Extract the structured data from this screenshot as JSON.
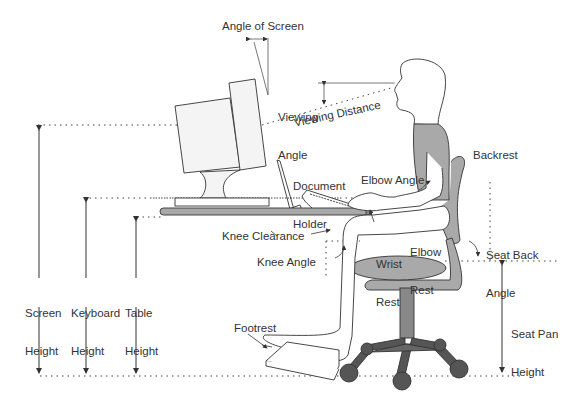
{
  "colors": {
    "line": "#333333",
    "fill_gray": "#a9a9a9",
    "dark_gray": "#555555",
    "screen_fill": "#f2f2f2",
    "background": "#ffffff"
  },
  "labels": {
    "angle_of_screen": "Angle of Screen",
    "viewing_angle": [
      "Viewing",
      "Angle"
    ],
    "viewing_distance": "Viewing Distance",
    "document_holder": [
      "Document",
      "Holder"
    ],
    "backrest": "Backrest",
    "elbow_angle": "Elbow Angle",
    "elbow_rest": [
      "Elbow",
      "Rest"
    ],
    "wrist_rest": [
      "Wrist",
      "Rest"
    ],
    "knee_clearance": "Knee Clearance",
    "knee_angle": "Knee Angle",
    "seat_back_angle": [
      "Seat Back",
      "Angle"
    ],
    "screen_height": [
      "Screen",
      "Height"
    ],
    "keyboard_height": [
      "Keyboard",
      "Height"
    ],
    "table_height": [
      "Table",
      "Height"
    ],
    "seat_pan_height": [
      "Seat Pan",
      "Height"
    ],
    "footrest": "Footrest"
  }
}
